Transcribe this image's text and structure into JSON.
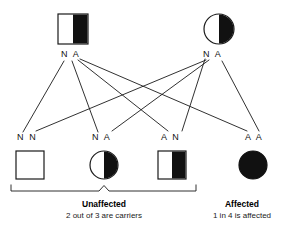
{
  "figure": {
    "parents": [
      {
        "id": "father",
        "sex": "male",
        "symbol": "square",
        "fill": "half",
        "genotype": "N A",
        "status": "carrier"
      },
      {
        "id": "mother",
        "sex": "female",
        "symbol": "circle",
        "fill": "half",
        "genotype": "N A",
        "status": "carrier"
      }
    ],
    "children": [
      {
        "id": "child-1",
        "sex": "male",
        "symbol": "square",
        "fill": "none",
        "genotype": "N N",
        "status": "unaffected-noncarrier"
      },
      {
        "id": "child-2",
        "sex": "female",
        "symbol": "circle",
        "fill": "half",
        "genotype": "N A",
        "status": "unaffected-carrier"
      },
      {
        "id": "child-3",
        "sex": "male",
        "symbol": "square",
        "fill": "half",
        "genotype": "A N",
        "status": "unaffected-carrier"
      },
      {
        "id": "child-4",
        "sex": "female",
        "symbol": "circle",
        "fill": "full",
        "genotype": "A A",
        "status": "affected"
      }
    ],
    "groups": [
      {
        "id": "unaffected-group",
        "title": "Unaffected",
        "subtitle": "2 out of 3 are carriers"
      },
      {
        "id": "affected-group",
        "title": "Affected",
        "subtitle": "1 in 4 is affected"
      }
    ],
    "footer_note": "",
    "colors": {
      "stroke": "#1a1a1a",
      "fill_dark": "#111111",
      "fill_light": "#ffffff",
      "background": "#ffffff"
    }
  }
}
